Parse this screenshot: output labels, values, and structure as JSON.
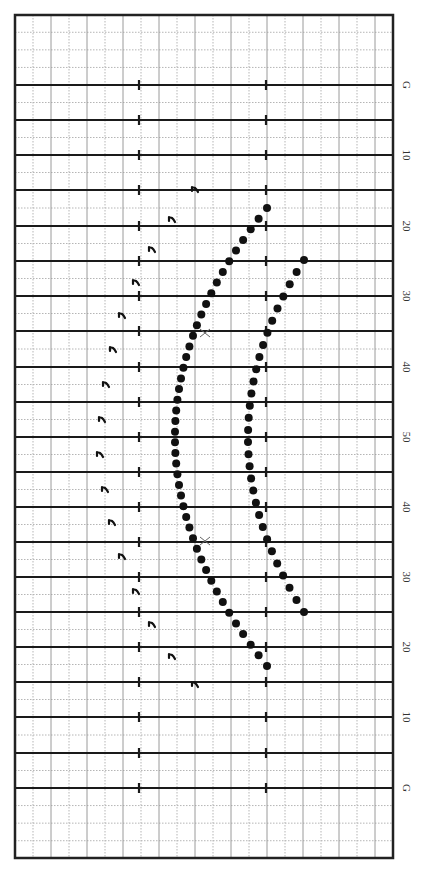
{
  "diagram": {
    "type": "football-field-play-diagram",
    "orientation": "vertical",
    "colors": {
      "background": "#ffffff",
      "field_border": "#222222",
      "yard_line": "#1a1a1a",
      "grid_solid": "#9a9a9a",
      "grid_dotted": "#b5b5b5",
      "marker": "#111111",
      "x_marker": "#666666"
    },
    "field": {
      "left": 15,
      "top": 15,
      "right": 393,
      "bottom": 858
    },
    "hash_marks_x": [
      139,
      266
    ],
    "yard_lines": [
      {
        "label": "G",
        "y": 85
      },
      {
        "label": "",
        "y": 120
      },
      {
        "label": "10",
        "y": 155
      },
      {
        "label": "",
        "y": 190
      },
      {
        "label": "20",
        "y": 226
      },
      {
        "label": "",
        "y": 261
      },
      {
        "label": "30",
        "y": 296
      },
      {
        "label": "",
        "y": 331
      },
      {
        "label": "40",
        "y": 367
      },
      {
        "label": "",
        "y": 402
      },
      {
        "label": "50",
        "y": 437
      },
      {
        "label": "",
        "y": 472
      },
      {
        "label": "40",
        "y": 507
      },
      {
        "label": "",
        "y": 542
      },
      {
        "label": "30",
        "y": 577
      },
      {
        "label": "",
        "y": 612
      },
      {
        "label": "20",
        "y": 647
      },
      {
        "label": "",
        "y": 682
      },
      {
        "label": "10",
        "y": 717
      },
      {
        "label": "",
        "y": 753
      },
      {
        "label": "G",
        "y": 788
      }
    ],
    "formations": {
      "outer_arc": {
        "name": "outer dot arc",
        "start": [
          267,
          208
        ],
        "vertex": [
          175,
          437
        ],
        "end": [
          267,
          666
        ],
        "count": 44,
        "dot_radius": 4
      },
      "inner_arc": {
        "name": "inner dot arc",
        "start": [
          304,
          260
        ],
        "vertex": [
          248,
          437
        ],
        "end": [
          304,
          612
        ],
        "count": 30,
        "dot_radius": 4
      },
      "r_markers": [
        [
          195,
          190
        ],
        [
          172,
          220
        ],
        [
          152,
          250
        ],
        [
          136,
          283
        ],
        [
          122,
          316
        ],
        [
          113,
          350
        ],
        [
          106,
          385
        ],
        [
          102,
          420
        ],
        [
          100,
          455
        ],
        [
          105,
          490
        ],
        [
          112,
          523
        ],
        [
          122,
          557
        ],
        [
          136,
          592
        ],
        [
          152,
          625
        ],
        [
          172,
          657
        ],
        [
          195,
          685
        ]
      ],
      "x_markers": [
        [
          205,
          333
        ],
        [
          205,
          541
        ]
      ]
    }
  }
}
